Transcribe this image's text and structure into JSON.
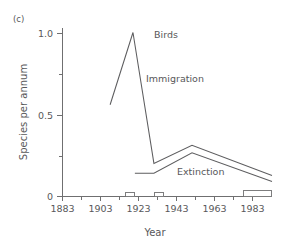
{
  "figure": {
    "panel_label": "(c)",
    "title": "Birds"
  },
  "axes": {
    "x_title": "Year",
    "y_title": "Species per annum",
    "x_tick_labels": [
      "1883",
      "1903",
      "1923",
      "1943",
      "1963",
      "1983"
    ],
    "y_tick_labels": [
      "0",
      "0.5",
      "1.0"
    ]
  },
  "annotations": {
    "immigration": "Immigration",
    "extinction": "Extinction"
  },
  "colors": {
    "line": "#5d5d5f",
    "axis": "#6f6f70",
    "text": "#58585a",
    "background": "#ffffff"
  },
  "chart_data": {
    "type": "line",
    "title": "Birds",
    "xlabel": "Year",
    "ylabel": "Species per annum",
    "xlim": [
      1883,
      1993
    ],
    "ylim": [
      0,
      1.12
    ],
    "grid": false,
    "legend": "inline-annotations",
    "x_ticks": [
      1883,
      1903,
      1923,
      1943,
      1963,
      1983
    ],
    "x_minor_ticks": [
      1893,
      1913,
      1933,
      1953,
      1973,
      1993
    ],
    "y_ticks": [
      0,
      0.5,
      1.0
    ],
    "y_minor_ticks": [
      0.25,
      0.75
    ],
    "series": [
      {
        "name": "Immigration",
        "x": [
          1908,
          1920,
          1931,
          1951,
          1993
        ],
        "values": [
          0.61,
          1.09,
          0.22,
          0.34,
          0.14
        ]
      },
      {
        "name": "Extinction",
        "x": [
          1921,
          1931,
          1951,
          1993
        ],
        "values": [
          0.155,
          0.155,
          0.29,
          0.1
        ]
      }
    ],
    "baseline_markers": [
      {
        "x_start": 1916,
        "x_end": 1921,
        "height": 0.02
      },
      {
        "x_start": 1931,
        "x_end": 1936,
        "height": 0.02
      },
      {
        "x_start": 1982,
        "x_end": 1993,
        "height": 0.03
      }
    ]
  }
}
